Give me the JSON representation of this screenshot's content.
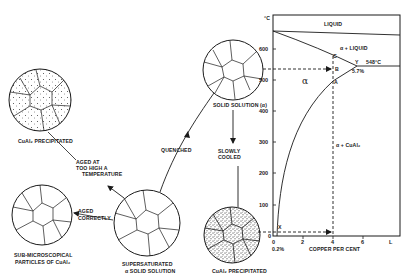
{
  "labels": {
    "top_left_circle": "CuAl₂ PRECIPITATED",
    "aged_too_high_1": "AGED AT",
    "aged_too_high_2": "TOO HIGH A",
    "aged_too_high_3": "TEMPERATURE",
    "quenched": "QUENCHED",
    "slowly_cooled_1": "SLOWLY",
    "slowly_cooled_2": "COOLED",
    "solid_solution": "SOLID SOLUTION (α)",
    "aged_correctly_1": "AGED",
    "aged_correctly_2": "CORRECTLY",
    "sub_micro_1": "SUB-MICROSCOPICAL",
    "sub_micro_2": "PARTICLES OF CuAl₂",
    "supersaturated_1": "SUPERSATURATED",
    "supersaturated_2": "α SOLID SOLUTION",
    "bottom_circle": "CuAl₂ PRECIPITATED"
  },
  "phase_diagram": {
    "y_unit": "°C",
    "y_ticks": [
      "600",
      "500",
      "400",
      "300",
      "200",
      "100",
      "0"
    ],
    "x_ticks": [
      "0",
      "2",
      "4",
      "6",
      "L"
    ],
    "x_label": "COPPER PER CENT",
    "x_note": "0.2%",
    "region_liquid": "LIQUID",
    "region_alpha_liquid": "α + LIQUID",
    "region_alpha": "α",
    "region_alpha_cual2": "α + CuAl₂",
    "eutectic_temp": "548°C",
    "eutectic_comp": "5.7%",
    "point_c": "C",
    "point_b": "B",
    "point_a": "A",
    "point_y": "Y",
    "point_x": "X"
  }
}
